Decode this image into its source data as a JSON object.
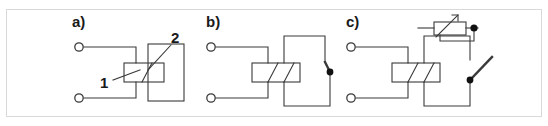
{
  "figure": {
    "frame_color": "#d9d9d9",
    "line_color": "#3a3a3a",
    "terminal_fill": "#ffffff",
    "dot_fill": "#111111",
    "background": "#ffffff"
  },
  "panels": [
    {
      "id": "a",
      "label": "a)",
      "description": "Relay coil with two numbered callouts",
      "callouts": [
        {
          "id": "1",
          "label": "1"
        },
        {
          "id": "2",
          "label": "2"
        }
      ],
      "terminals": [
        {
          "id": "a-terminal-top",
          "type": "open-circle"
        },
        {
          "id": "a-terminal-bottom",
          "type": "open-circle"
        }
      ],
      "components": [
        {
          "id": "a-coil",
          "type": "coil-rectangle"
        },
        {
          "id": "a-contact-frame",
          "type": "contact-rectangle"
        }
      ]
    },
    {
      "id": "b",
      "label": "b)",
      "description": "Relay coil with closed contact switch",
      "callouts": [],
      "terminals": [
        {
          "id": "b-terminal-top",
          "type": "open-circle"
        },
        {
          "id": "b-terminal-bottom",
          "type": "open-circle"
        }
      ],
      "components": [
        {
          "id": "b-coil",
          "type": "coil-rectangle"
        },
        {
          "id": "b-switch",
          "type": "closed-contact"
        },
        {
          "id": "b-switch-node",
          "type": "filled-dot"
        }
      ]
    },
    {
      "id": "c",
      "label": "c)",
      "description": "Relay coil with open contact switch and adjustable element",
      "callouts": [],
      "terminals": [
        {
          "id": "c-terminal-top",
          "type": "open-circle"
        },
        {
          "id": "c-terminal-bottom",
          "type": "open-circle"
        }
      ],
      "components": [
        {
          "id": "c-coil",
          "type": "coil-rectangle"
        },
        {
          "id": "c-switch",
          "type": "open-contact"
        },
        {
          "id": "c-switch-node",
          "type": "filled-dot"
        },
        {
          "id": "c-adjustable",
          "type": "adjustable-resistor"
        },
        {
          "id": "c-adjustable-node",
          "type": "filled-dot"
        }
      ]
    }
  ]
}
